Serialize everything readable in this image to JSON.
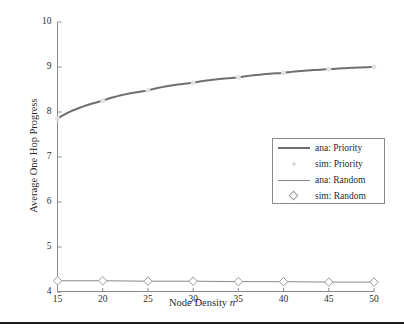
{
  "chart_data": {
    "type": "line",
    "title": "",
    "xlabel": "Node Density n",
    "xlabel_text": "Node Density",
    "xlabel_var": "n",
    "ylabel": "Average One Hop Progress",
    "xlim": [
      15,
      50
    ],
    "ylim": [
      4,
      10
    ],
    "xticks": [
      15,
      20,
      25,
      30,
      35,
      40,
      45,
      50
    ],
    "yticks": [
      4,
      5,
      6,
      7,
      8,
      9,
      10
    ],
    "grid": false,
    "legend_position": "center-right",
    "x": [
      15,
      20,
      25,
      30,
      35,
      40,
      45,
      50
    ],
    "series": [
      {
        "name": "ana: Priority",
        "style": "line",
        "color": "#6f6f6f",
        "linewidth": 2,
        "values": [
          7.85,
          8.25,
          8.48,
          8.65,
          8.77,
          8.87,
          8.95,
          9.0
        ]
      },
      {
        "name": "sim: Priority",
        "style": "marker",
        "marker": "dot",
        "color": "#e3e3e3",
        "values": [
          7.85,
          8.25,
          8.48,
          8.65,
          8.77,
          8.87,
          8.95,
          9.0
        ]
      },
      {
        "name": "ana: Random",
        "style": "line",
        "color": "#8a8a8a",
        "linewidth": 1,
        "values": [
          4.25,
          4.25,
          4.24,
          4.24,
          4.23,
          4.23,
          4.22,
          4.22
        ]
      },
      {
        "name": "sim: Random",
        "style": "marker",
        "marker": "diamond",
        "color": "#9a9a9a",
        "values": [
          4.25,
          4.25,
          4.24,
          4.24,
          4.23,
          4.23,
          4.22,
          4.22
        ]
      }
    ]
  },
  "legend": {
    "entries": [
      {
        "label": "ana: Priority",
        "key": "line-thick"
      },
      {
        "label": "sim: Priority",
        "key": "dot"
      },
      {
        "label": "ana: Random",
        "key": "line-thin"
      },
      {
        "label": "sim: Random",
        "key": "diamond"
      }
    ]
  },
  "axes": {
    "y_tick_labels": [
      "10",
      "9",
      "8",
      "7",
      "6",
      "5",
      "4"
    ],
    "x_tick_labels": [
      "15",
      "20",
      "25",
      "30",
      "35",
      "40",
      "45",
      "50"
    ]
  }
}
